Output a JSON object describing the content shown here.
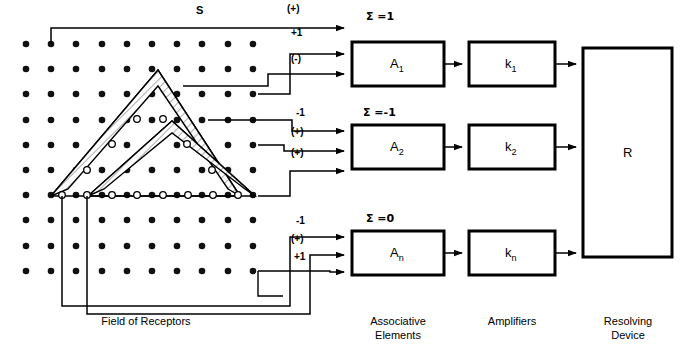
{
  "diagram": {
    "title_signal": "S",
    "grid": {
      "rows": 10,
      "cols": 10,
      "x0": 26,
      "y0": 44,
      "step": 25.2,
      "dot_color": "#111111",
      "open_dot_color": "#ffffff"
    },
    "open_dots": [
      {
        "x": 137,
        "y": 119
      },
      {
        "x": 163,
        "y": 119
      },
      {
        "x": 112,
        "y": 144
      },
      {
        "x": 187,
        "y": 144
      },
      {
        "x": 87,
        "y": 170
      },
      {
        "x": 212,
        "y": 170
      },
      {
        "x": 62,
        "y": 195
      },
      {
        "x": 87,
        "y": 195
      },
      {
        "x": 112,
        "y": 195
      },
      {
        "x": 137,
        "y": 195
      },
      {
        "x": 163,
        "y": 195
      },
      {
        "x": 188,
        "y": 195
      },
      {
        "x": 213,
        "y": 195
      },
      {
        "x": 238,
        "y": 195
      }
    ],
    "triangles": [
      {
        "name": "triangle-outer",
        "points": "51,196 158,70 240,196"
      },
      {
        "name": "triangle-inner",
        "points": "88,196 172,121 255,196"
      }
    ],
    "channels": [
      {
        "id": "channel-1",
        "sum_label": "Σ =1",
        "element_label": "A",
        "element_sub": "1",
        "amplifier_label": "k",
        "amplifier_sub": "1",
        "wires": [
          {
            "label": "(+)",
            "label_x": 287,
            "label_y": 9
          },
          {
            "label": "+1",
            "label_x": 291,
            "label_y": 31
          },
          {
            "label": "(-)",
            "label_x": 291,
            "label_y": 56
          }
        ]
      },
      {
        "id": "channel-2",
        "sum_label": "Σ =-1",
        "element_label": "A",
        "element_sub": "2",
        "amplifier_label": "k",
        "amplifier_sub": "2",
        "wires": [
          {
            "label": "-1",
            "label_x": 296,
            "label_y": 113
          },
          {
            "label": "(+)",
            "label_x": 291,
            "label_y": 132
          },
          {
            "label": "(+)",
            "label_x": 291,
            "label_y": 153
          }
        ]
      },
      {
        "id": "channel-n",
        "sum_label": "Σ =0",
        "element_label": "A",
        "element_sub": "n",
        "amplifier_label": "k",
        "amplifier_sub": "n",
        "wires": [
          {
            "label": "-1",
            "label_x": 296,
            "label_y": 222
          },
          {
            "label": "(+)",
            "label_x": 291,
            "label_y": 240
          },
          {
            "label": "+1",
            "label_x": 294,
            "label_y": 258
          }
        ]
      }
    ],
    "resolving_label": "R",
    "captions": [
      {
        "name": "caption-field-of-receptors",
        "line1": "Field of Receptors",
        "line2": "",
        "x": 56,
        "y": 322,
        "w": 180
      },
      {
        "name": "caption-associative-elements",
        "line1": "Associative",
        "line2": "Elements",
        "x": 352,
        "y": 322,
        "w": 92
      },
      {
        "name": "caption-amplifiers",
        "line1": "Amplifiers",
        "line2": "",
        "x": 469,
        "y": 322,
        "w": 86
      },
      {
        "name": "caption-resolving-device",
        "line1": "Resolving",
        "line2": "Device",
        "x": 583,
        "y": 322,
        "w": 90
      }
    ],
    "boxes": {
      "a1": {
        "x": 352,
        "y": 42,
        "w": 92,
        "h": 44
      },
      "k1": {
        "x": 469,
        "y": 42,
        "w": 86,
        "h": 44
      },
      "a2": {
        "x": 352,
        "y": 125,
        "w": 92,
        "h": 44
      },
      "k2": {
        "x": 469,
        "y": 125,
        "w": 86,
        "h": 44
      },
      "an": {
        "x": 352,
        "y": 231,
        "w": 92,
        "h": 44
      },
      "kn": {
        "x": 469,
        "y": 231,
        "w": 86,
        "h": 44
      },
      "r": {
        "x": 583,
        "y": 48,
        "w": 89,
        "h": 209
      }
    },
    "colors": {
      "ink": "#000000",
      "paper": "#ffffff",
      "hatch": "#5a5a5a"
    }
  }
}
